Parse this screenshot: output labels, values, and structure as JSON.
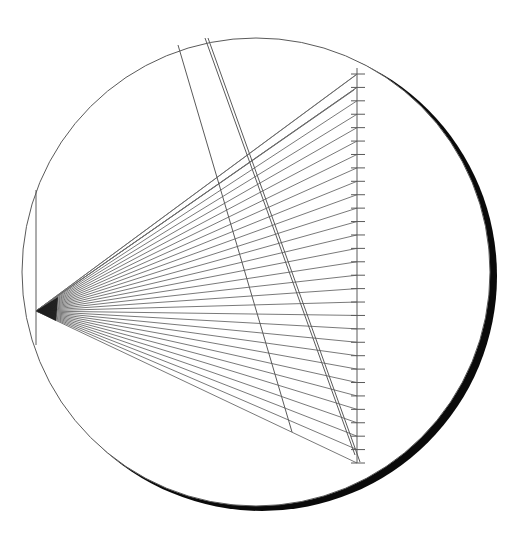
{
  "diagram": {
    "canvas": {
      "width": 510,
      "height": 536,
      "background": "#ffffff"
    },
    "colors": {
      "line": "#5a5a5a",
      "fan": "#6a6a6a",
      "shadow": "#0a0a0a",
      "apex": "#111111"
    },
    "circle": {
      "cx": 256,
      "cy": 272,
      "r": 234
    },
    "shadow_crescent": {
      "cx": 262,
      "cy": 276,
      "r": 234,
      "thickness_max": 10
    },
    "apex": {
      "x": 36,
      "y": 311
    },
    "left_chord": {
      "x": 36,
      "y1": 190,
      "y2": 345
    },
    "ruler": {
      "x": 357,
      "y_top": 68,
      "y_bottom": 463,
      "tick_count": 30,
      "tick_len_left": 6,
      "tick_len_right": 8
    },
    "fan": {
      "count": 30,
      "extra_top_lines": [
        {
          "x": 356,
          "y": 75
        },
        {
          "x": 356,
          "y": 88
        },
        {
          "x": 354,
          "y": 90
        }
      ]
    },
    "diagonals": [
      {
        "x1": 178,
        "y1": 45,
        "x2": 292,
        "y2": 432
      },
      {
        "x1": 205,
        "y1": 38,
        "x2": 355,
        "y2": 455
      },
      {
        "x1": 208,
        "y1": 38,
        "x2": 360,
        "y2": 462
      }
    ]
  }
}
